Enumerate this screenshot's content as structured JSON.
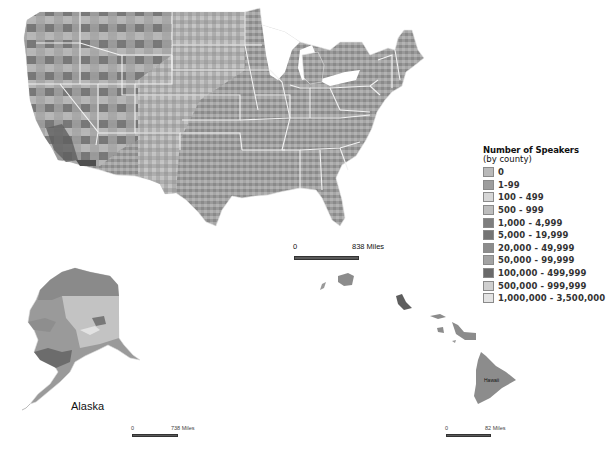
{
  "map": {
    "title": "Number of Speakers",
    "subtitle": "(by county)",
    "regions": {
      "alaska_label": "Alaska",
      "hawaii_label": "Hawaii"
    }
  },
  "legend": {
    "title": "Number of Speakers",
    "subtitle": "(by county)",
    "items": [
      {
        "label": "0",
        "color": "#b9b9b9"
      },
      {
        "label": "1-99",
        "color": "#9d9d9d"
      },
      {
        "label": "100 - 499",
        "color": "#d6d6d6"
      },
      {
        "label": "500 - 999",
        "color": "#bdbdbd"
      },
      {
        "label": "1,000 - 4,999",
        "color": "#7e7e7e"
      },
      {
        "label": "5,000 - 19,999",
        "color": "#747474"
      },
      {
        "label": "20,000 - 49,999",
        "color": "#8c8c8c"
      },
      {
        "label": "50,000 - 99,999",
        "color": "#a3a3a3"
      },
      {
        "label": "100,000 - 499,999",
        "color": "#6a6a6a"
      },
      {
        "label": "500,000 - 999,999",
        "color": "#cfcfcf"
      },
      {
        "label": "1,000,000 - 3,500,000",
        "color": "#e3e3e3"
      }
    ]
  },
  "scales": {
    "contiguous": {
      "zero": "0",
      "max": "838 Miles"
    },
    "alaska": {
      "zero": "0",
      "max": "738 Miles"
    },
    "hawaii": {
      "zero": "0",
      "max": "82 Miles"
    }
  }
}
